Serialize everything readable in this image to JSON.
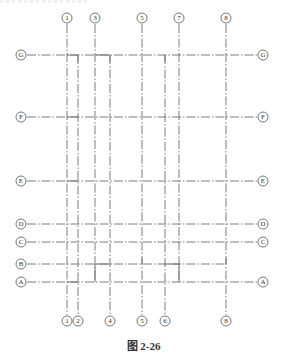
{
  "figure": {
    "caption": "图 2-26",
    "type": "structural axis grid plan"
  },
  "vertical_axes": {
    "top_labels": [
      "1",
      "3",
      "5",
      "7",
      "8"
    ],
    "bottom_labels": [
      "1",
      "2",
      "4",
      "5",
      "6",
      "8"
    ],
    "positions": {
      "1": 67,
      "2": 78,
      "3": 95,
      "4": 110,
      "5": 142,
      "6": 165,
      "7": 179,
      "8": 226
    }
  },
  "horizontal_axes": {
    "left_labels": [
      "G",
      "F",
      "E",
      "D",
      "C",
      "B",
      "A"
    ],
    "right_labels": [
      "G",
      "F",
      "E",
      "D",
      "C",
      "A"
    ],
    "positions": {
      "G": 55,
      "F": 117,
      "E": 181,
      "D": 224,
      "C": 242,
      "B": 264,
      "A": 282
    }
  },
  "labels": {
    "t1": "1",
    "t3": "3",
    "t5": "5",
    "t7": "7",
    "t8": "8",
    "b1": "1",
    "b2": "2",
    "b4": "4",
    "b5": "5",
    "b6": "6",
    "b8": "8",
    "lG": "G",
    "lF": "F",
    "lE": "E",
    "lD": "D",
    "lC": "C",
    "lB": "B",
    "lA": "A",
    "rG": "G",
    "rF": "F",
    "rE": "E",
    "rD": "D",
    "rC": "C",
    "rA": "A"
  }
}
